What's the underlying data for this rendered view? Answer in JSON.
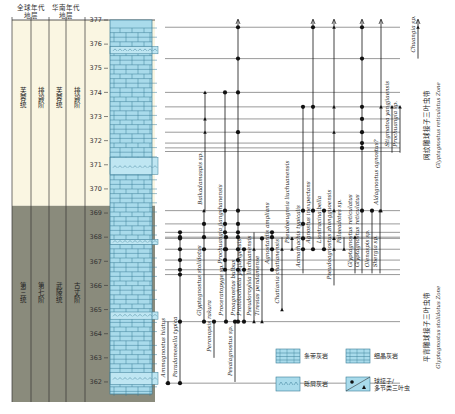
{
  "header": {
    "global_strata": [
      "全球年代",
      "地层"
    ],
    "south_china_strata": [
      "华南年代",
      "地层"
    ],
    "height_label": "高度",
    "height_unit": "(m)"
  },
  "strata_columns": {
    "upper": [
      "芙蓉统",
      "排碧阶",
      "芙蓉统",
      "排碧阶"
    ],
    "lower": [
      "第三统",
      "第七阶",
      "武陵统",
      "古丈阶"
    ],
    "upper_color": "#faf6e2",
    "lower_color": "#8a8b7c",
    "boundary_m": 369.3
  },
  "axis": {
    "min": 361.5,
    "max": 377,
    "ticks": [
      362,
      363,
      364,
      365,
      366,
      367,
      368,
      369,
      370,
      371,
      372,
      373,
      374,
      375,
      376,
      377
    ]
  },
  "lithology": {
    "base_color": "#a9dbeb",
    "line_color": "#3b7d96",
    "oolitic_beds_m": [
      [
        370.6,
        371.3
      ],
      [
        375.6,
        375.9
      ],
      [
        367.7,
        367.9
      ],
      [
        364.6,
        364.9
      ],
      [
        361.9,
        362.4
      ]
    ]
  },
  "sample_levels_m": [
    376.7,
    375.4,
    374.0,
    373.4,
    372.9,
    372.35,
    371.9,
    371.7,
    371.55,
    369.1,
    368.55,
    368.2,
    368.0,
    367.95,
    367.5,
    367.05,
    366.65,
    366.45,
    364.5,
    361.95
  ],
  "taxa": [
    {
      "name": "Ammagnostus hiatus",
      "x": 168,
      "from": 361.95,
      "to": 364.5,
      "markers": [
        [
          361.95,
          "dot"
        ],
        [
          361.95,
          "tri"
        ]
      ]
    },
    {
      "name": "Paradamesella typica",
      "x": 180,
      "from": 361.95,
      "to": 368.2,
      "markers": [
        [
          361.95,
          "dot"
        ],
        [
          364.5,
          "dot"
        ],
        [
          366.45,
          "dot"
        ],
        [
          366.65,
          "dot"
        ],
        [
          367.05,
          "dot"
        ],
        [
          367.5,
          "dot"
        ],
        [
          367.95,
          "dot"
        ],
        [
          368.0,
          "dot"
        ],
        [
          368.2,
          "dot"
        ]
      ]
    },
    {
      "name": "Glyptagnostus stolidotus",
      "x": 204,
      "from": 364.5,
      "to": 369.1,
      "markers": [
        [
          364.5,
          "dot"
        ],
        [
          367.5,
          "dot"
        ],
        [
          368.0,
          "dot"
        ],
        [
          368.55,
          "dot"
        ],
        [
          369.1,
          "tri"
        ]
      ]
    },
    {
      "name": "Peronopsis rakura",
      "x": 214,
      "from": 363.0,
      "to": 364.5,
      "markers": [
        [
          364.5,
          "dot"
        ]
      ]
    },
    {
      "name": "Proceratopyge sp.",
      "x": 226,
      "from": 364.5,
      "to": 368.0,
      "markers": [
        [
          364.5,
          "dot"
        ],
        [
          367.5,
          "dot"
        ],
        [
          368.0,
          "dot"
        ]
      ]
    },
    {
      "name": "Pesaiagnostus sp.",
      "x": 235,
      "from": 362.0,
      "to": 364.5,
      "markers": [
        [
          364.5,
          "dot"
        ]
      ]
    },
    {
      "name": "Baikadamaspis sp.",
      "x": 205,
      "from": 369.1,
      "to": 374.0,
      "markers": [
        [
          372.9,
          "tri"
        ],
        [
          374.0,
          "tri"
        ],
        [
          372.35,
          "tri"
        ]
      ]
    },
    {
      "name": "Prochuangia jiangshanensis",
      "x": 225,
      "from": 366.65,
      "to": 374.0,
      "markers": [
        [
          374.0,
          "dot"
        ],
        [
          369.1,
          "dot"
        ],
        [
          368.55,
          "dot"
        ],
        [
          368.2,
          "dot"
        ],
        [
          367.5,
          "dot"
        ],
        [
          367.05,
          "dot"
        ],
        [
          366.65,
          "dot"
        ]
      ]
    },
    {
      "name": "Proagnostus bulbus",
      "x": 238,
      "from": 364.5,
      "to": 377.0,
      "markers": [
        [
          376.7,
          "dot"
        ],
        [
          375.4,
          "dot"
        ],
        [
          374.0,
          "dot"
        ],
        [
          372.35,
          "dot"
        ],
        [
          369.1,
          "dot"
        ],
        [
          368.55,
          "dot"
        ],
        [
          368.2,
          "dot"
        ],
        [
          368.0,
          "dot"
        ],
        [
          367.5,
          "dot"
        ],
        [
          367.05,
          "dot"
        ],
        [
          366.65,
          "dot"
        ],
        [
          364.5,
          "dot"
        ]
      ]
    },
    {
      "name": "Protolochotia yuqiangensis",
      "x": 244,
      "from": 364.5,
      "to": 367.5,
      "markers": [
        [
          364.5,
          "dot"
        ],
        [
          366.65,
          "dot"
        ],
        [
          367.5,
          "dot"
        ]
      ]
    },
    {
      "name": "Pseudoroylsia linchuanensis",
      "x": 254,
      "from": 364.5,
      "to": 368.2,
      "markers": [
        [
          364.5,
          "tri"
        ],
        [
          367.5,
          "tri"
        ]
      ]
    },
    {
      "name": "Tiresias pendamense",
      "x": 262,
      "from": 364.5,
      "to": 367.95,
      "markers": [
        [
          364.5,
          "tri"
        ],
        [
          367.95,
          "dot"
        ]
      ]
    },
    {
      "name": "Agnostardis amplians",
      "x": 272,
      "from": 366.65,
      "to": 368.2,
      "markers": [
        [
          368.2,
          "dot"
        ],
        [
          368.0,
          "dot"
        ],
        [
          367.5,
          "dot"
        ],
        [
          366.65,
          "dot"
        ]
      ]
    },
    {
      "name": "Chatiania chatianensis",
      "x": 282,
      "from": 365.0,
      "to": 368.0,
      "markers": [
        [
          367.5,
          "tri"
        ],
        [
          365.0,
          "tri"
        ]
      ]
    },
    {
      "name": "Pseudoeugreia liuchuanensis",
      "x": 292,
      "from": 367.5,
      "to": 368.0,
      "markers": [
        [
          367.95,
          "tri"
        ],
        [
          367.5,
          "tri"
        ]
      ]
    },
    {
      "name": "Acmarhachis typicalis",
      "x": 303,
      "from": 366.5,
      "to": 373.4,
      "markers": [
        [
          373.4,
          "dot"
        ],
        [
          369.1,
          "dot"
        ],
        [
          368.55,
          "dot"
        ],
        [
          367.95,
          "dot"
        ],
        [
          367.5,
          "dot"
        ]
      ]
    },
    {
      "name": "Agnostus inexpectans",
      "x": 313,
      "from": 367.5,
      "to": 377.0,
      "markers": [
        [
          376.7,
          "dot"
        ],
        [
          373.4,
          "dot"
        ],
        [
          369.1,
          "dot"
        ],
        [
          367.5,
          "dot"
        ]
      ]
    },
    {
      "name": "Liostracina bella",
      "x": 324,
      "from": 367.5,
      "to": 369.1,
      "markers": [
        [
          369.1,
          "dot"
        ],
        [
          367.5,
          "dot"
        ]
      ]
    },
    {
      "name": "Pseudoagnostus zhongguoensis",
      "x": 334,
      "from": 366.0,
      "to": 377.0,
      "markers": [
        [
          376.7,
          "tri"
        ],
        [
          373.4,
          "tri"
        ],
        [
          372.35,
          "tri"
        ],
        [
          369.1,
          "tri"
        ],
        [
          367.95,
          "tri"
        ],
        [
          367.5,
          "tri"
        ]
      ]
    },
    {
      "name": "Palaeadotes sp.",
      "x": 344,
      "from": 367.5,
      "to": 368.0,
      "markers": [
        [
          367.5,
          "tri"
        ]
      ]
    },
    {
      "name": "Glyptagnostus reticulatus",
      "x": 355,
      "from": 366.5,
      "to": 368.0,
      "markers": [
        [
          368.0,
          "tri"
        ]
      ]
    },
    {
      "name": "Glyptagnostus reticulatus",
      "x": 362,
      "from": 366.5,
      "to": 377.0,
      "markers": [
        [
          376.7,
          "dot"
        ],
        [
          375.4,
          "dot"
        ],
        [
          373.4,
          "dot"
        ],
        [
          372.9,
          "dot"
        ],
        [
          372.35,
          "dot"
        ],
        [
          371.9,
          "dot"
        ],
        [
          371.7,
          "dot"
        ],
        [
          369.1,
          "dot"
        ]
      ]
    },
    {
      "name": "Olenaspis sp.",
      "x": 372,
      "from": 366.5,
      "to": 369.1,
      "markers": [
        [
          369.1,
          "dot"
        ]
      ]
    },
    {
      "name": "Aldagnostus agnostus?",
      "x": 381,
      "from": 369.1,
      "to": 377.0,
      "markers": [
        [
          373.4,
          "tri"
        ],
        [
          369.1,
          "tri"
        ]
      ]
    },
    {
      "name": "Shergia sp.",
      "x": 380,
      "from": 366.5,
      "to": 369.1,
      "markers": [
        [
          369.1,
          "tri"
        ]
      ]
    },
    {
      "name": "Stigmatoa yangjiaensis",
      "x": 392,
      "from": 371.5,
      "to": 373.4,
      "markers": [
        [
          373.4,
          "tri"
        ]
      ]
    },
    {
      "name": "Prochuangia sp.",
      "x": 400,
      "from": 371.5,
      "to": 373.4,
      "markers": [
        [
          373.4,
          "tri"
        ]
      ]
    },
    {
      "name": "Chuangia sp.",
      "x": 418,
      "from": 375.4,
      "to": 377.0,
      "markers": [
        [
          376.7,
          "tri"
        ]
      ]
    }
  ],
  "zones": [
    {
      "cn": "网纹雕球接子三叶虫带",
      "en": "Glyptagnostus reticulatus Zone",
      "from": 369.1,
      "to": 377.0
    },
    {
      "cn": "平背雕球接子三叶虫带",
      "en": "Glyptagnostus stolidotus Zone",
      "from": 361.5,
      "to": 369.1
    }
  ],
  "legend": {
    "items": [
      {
        "label": "条带灰岩",
        "type": "banded-limestone"
      },
      {
        "label": "细晶灰岩",
        "type": "fine-crystalline-limestone"
      },
      {
        "label": "砾屑灰岩",
        "type": "calcirudite"
      },
      {
        "label": "球接子/多节类三叶虫",
        "line1": "球接子/",
        "line2": "多节类三叶虫",
        "type": "fossil-symbols"
      }
    ]
  }
}
